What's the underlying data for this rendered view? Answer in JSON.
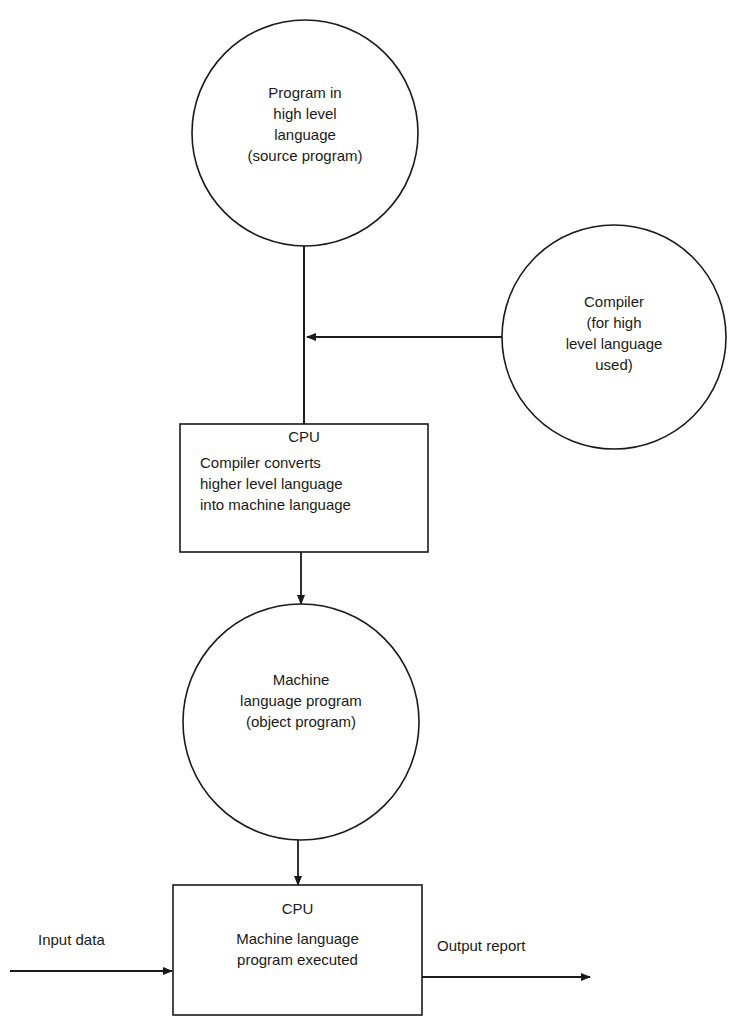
{
  "diagram": {
    "nodes": {
      "source_program": {
        "shape": "circle",
        "lines": [
          "Program in",
          "high level",
          "language",
          "(source program)"
        ]
      },
      "compiler": {
        "shape": "circle",
        "lines": [
          "Compiler",
          "(for high",
          "level language",
          "used)"
        ]
      },
      "cpu_compile": {
        "shape": "rectangle",
        "title": "CPU",
        "lines": [
          "Compiler converts",
          "higher level language",
          "into machine language"
        ]
      },
      "object_program": {
        "shape": "circle",
        "lines": [
          "Machine",
          "language program",
          "(object program)"
        ]
      },
      "cpu_execute": {
        "shape": "rectangle",
        "title": "CPU",
        "lines": [
          "Machine language",
          "program executed"
        ]
      }
    },
    "edges": [
      {
        "from": "source_program",
        "to": "cpu_compile",
        "arrow": false
      },
      {
        "from": "compiler",
        "to": "source_program-cpu_compile line",
        "arrow": true
      },
      {
        "from": "cpu_compile",
        "to": "object_program",
        "arrow": true
      },
      {
        "from": "object_program",
        "to": "cpu_execute",
        "arrow": true
      },
      {
        "from": "input",
        "to": "cpu_execute",
        "arrow": true,
        "label": "Input data"
      },
      {
        "from": "cpu_execute",
        "to": "output",
        "arrow": true,
        "label": "Output report"
      }
    ],
    "labels": {
      "input": "Input data",
      "output": "Output report"
    },
    "colors": {
      "stroke": "#1a1a1a",
      "background": "#ffffff"
    }
  }
}
